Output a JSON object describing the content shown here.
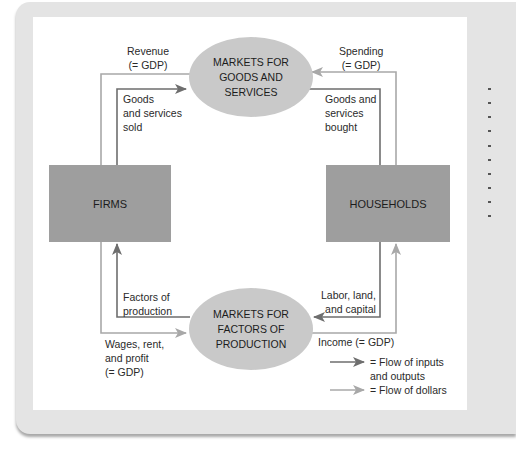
{
  "diagram": {
    "nodes": {
      "firms": "FIRMS",
      "households": "HOUSEHOLDS",
      "goods_market": "MARKETS FOR\nGOODS AND\nSERVICES",
      "factor_market": "MARKETS FOR\nFACTORS OF\nPRODUCTION"
    },
    "labels": {
      "revenue": "Revenue\n(= GDP)",
      "goods_sold": "Goods\nand services\nsold",
      "spending": "Spending\n(= GDP)",
      "goods_bought": "Goods and\nservices\nbought",
      "factors": "Factors of\nproduction",
      "wages": "Wages, rent,\nand profit\n(= GDP)",
      "labor": "Labor, land,\nand capital",
      "income": "Income (= GDP)"
    },
    "legend": {
      "inputs_outputs": "= Flow of inputs\nand outputs",
      "dollars": "= Flow of dollars"
    },
    "colors": {
      "inputs_outputs_flow": "#6e6e6e",
      "dollars_flow": "#a8a8a8",
      "box_fill": "#9e9e9e",
      "oval_fill": "#c9c9c9",
      "frame": "#e4e4e4"
    }
  }
}
